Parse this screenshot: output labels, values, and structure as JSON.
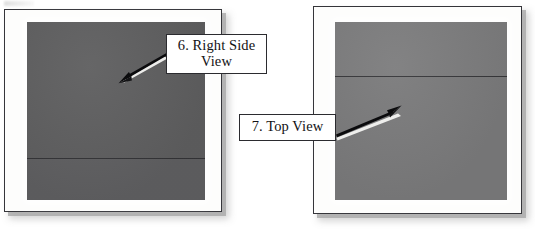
{
  "figure": {
    "name": "two-photograph-figure-with-numbered-callouts",
    "background_color": "#ffffff",
    "width": 535,
    "height": 230
  },
  "panels": [
    {
      "id": "right-side-view",
      "photo_color": "#5f5f60",
      "photo_color_lower": "#606062",
      "mount_color": "#fdfdfc",
      "border_color": "#35353a",
      "divider_offset_pct": 76.5,
      "divider_color": "#2e2e31"
    },
    {
      "id": "top-view",
      "photo_color": "#7d7d7e",
      "photo_color_lower": "#7b7b7c",
      "mount_color": "#fdfdfc",
      "border_color": "#35353a",
      "divider_offset_pct": 30.5,
      "divider_color": "#2e2e31"
    }
  ],
  "callouts": [
    {
      "id": "right-side-view",
      "number": "6.",
      "text": "6. Right Side View",
      "line1": "6. Right Side",
      "line2": "View",
      "arrow_from": [
        166,
        56
      ],
      "arrow_to": [
        120,
        80
      ]
    },
    {
      "id": "top-view",
      "number": "7.",
      "text": "7. Top View",
      "line1": "7. Top View",
      "line2": "",
      "arrow_from": [
        337,
        135
      ],
      "arrow_to": [
        398,
        110
      ]
    }
  ],
  "colors": {
    "page_background": "#ffffff",
    "ink": "#121214",
    "shadow": "#a8a8a8",
    "arrow": "#0b0b0d",
    "arrow_highlight": "#f2f2f0"
  }
}
